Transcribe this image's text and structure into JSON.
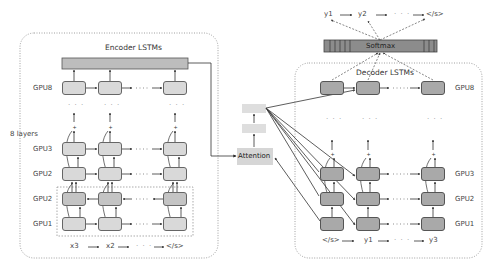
{
  "encoder": {
    "title": "Encoder LSTMs",
    "layers_label": "8 layers",
    "rows": [
      {
        "label": "GPU8",
        "y": 81,
        "kind": "uni"
      },
      {
        "label": "GPU3",
        "y": 142,
        "kind": "uni"
      },
      {
        "label": "GPU2",
        "y": 167,
        "kind": "uni"
      },
      {
        "label": "GPU2",
        "y": 192,
        "kind": "bidir"
      },
      {
        "label": "GPU1",
        "y": 217,
        "kind": "uni"
      }
    ],
    "inputs": [
      "x3",
      "x2",
      "</s>"
    ],
    "ellipsis": "· · ·"
  },
  "attention": {
    "label": "Attention"
  },
  "decoder": {
    "title": "Decoder LSTMs",
    "rows": [
      {
        "label": "GPU8",
        "y": 81
      },
      {
        "label": "GPU3",
        "y": 167
      },
      {
        "label": "GPU2",
        "y": 192
      },
      {
        "label": "GPU1",
        "y": 217
      }
    ],
    "inputs": [
      "</s>",
      "y1",
      "y3"
    ],
    "ellipsis": "· · ·"
  },
  "softmax": {
    "label": "Softmax"
  },
  "outputs": [
    "y1",
    "y2",
    "</s>"
  ],
  "colors": {
    "encoder_node": "#d9d9d9",
    "encoder_bidir_node": "#c4c4c4",
    "decoder_node": "#a9a9a9",
    "softmax_bar": "#8c8c8c",
    "encoder_bar": "#bdbdbd",
    "attention_box": "#d6d6d6"
  }
}
